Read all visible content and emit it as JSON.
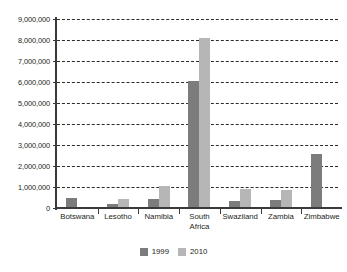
{
  "chart_data": {
    "type": "bar",
    "title": "",
    "subtitle": "",
    "xlabel": "",
    "ylabel": "",
    "ylim": [
      0,
      9000000
    ],
    "ytick_step": 1000000,
    "grid": true,
    "legend_position": "bottom",
    "categories": [
      "Botswana",
      "Lesotho",
      "Namibia",
      "South\nAfrica",
      "Swaziland",
      "Zambia",
      "Zimbabwe"
    ],
    "ytick_labels": [
      "0",
      "1,000,000",
      "2,000,000",
      "3,000,000",
      "4,000,000",
      "5,000,000",
      "6,000,000",
      "7,000,000",
      "8,000,000",
      "9,000,000"
    ],
    "ytick_values": [
      0,
      1000000,
      2000000,
      3000000,
      4000000,
      5000000,
      6000000,
      7000000,
      8000000,
      9000000
    ],
    "series": [
      {
        "name": "1999",
        "color": "#7c7c7c",
        "values": [
          480000,
          200000,
          420000,
          6060000,
          350000,
          380000,
          2550000
        ]
      },
      {
        "name": "2010",
        "color": "#b6b6b6",
        "values": [
          0,
          420000,
          1060000,
          8100000,
          900000,
          860000,
          0
        ]
      }
    ]
  },
  "legend": {
    "items": [
      {
        "label": "1999",
        "color": "#7c7c7c"
      },
      {
        "label": "2010",
        "color": "#b6b6b6"
      }
    ]
  }
}
